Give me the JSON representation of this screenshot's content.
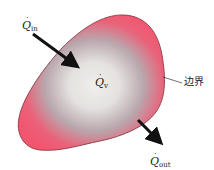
{
  "diagram": {
    "type": "control-volume-heat-balance",
    "colors": {
      "boundary_edge": "#8a3a4a",
      "outer_fill": "#f2566e",
      "mid_fill": "#b9a7ad",
      "inner_fill": "#ececea",
      "arrow": "#111111",
      "text": "#222222",
      "background": "#ffffff"
    },
    "labels": {
      "q_in": {
        "symbol": "Q",
        "dot": "˙",
        "subscript": "in"
      },
      "q_v": {
        "symbol": "Q",
        "dot": "˙",
        "subscript": "v"
      },
      "q_out": {
        "symbol": "Q",
        "dot": "˙",
        "subscript": "out"
      },
      "boundary": "边界"
    },
    "arrows": [
      {
        "name": "heat-in-arrow",
        "from": [
          33,
          34
        ],
        "to": [
          76,
          66
        ]
      },
      {
        "name": "heat-out-arrow",
        "from": [
          138,
          120
        ],
        "to": [
          162,
          144
        ]
      }
    ],
    "leader_line": {
      "from": [
        163,
        77
      ],
      "to": [
        183,
        83
      ]
    }
  }
}
